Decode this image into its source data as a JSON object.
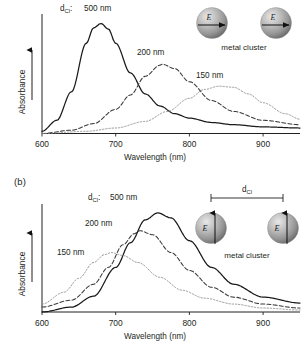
{
  "figure": {
    "panels": [
      {
        "id": "a",
        "label": "",
        "axes": {
          "xlabel": "Wavelength (nm)",
          "ylabel": "Absorbance",
          "xticks": [
            "600",
            "700",
            "800",
            "900"
          ],
          "xlim": [
            600,
            950
          ]
        },
        "prefix_label": "d",
        "prefix_sub": "Cl",
        "prefix_colon": ":",
        "cluster": {
          "caption": "metal cluster",
          "field_label_left": "E",
          "field_label_right": "E",
          "field_orientation": "horizontal",
          "distance_bracket": false,
          "distance_label": "",
          "distance_sub": ""
        }
      },
      {
        "id": "b",
        "label": "(b)",
        "axes": {
          "xlabel": "Wavelength (nm)",
          "ylabel": "Absorbance",
          "xticks": [
            "600",
            "700",
            "800",
            "900"
          ],
          "xlim": [
            600,
            950
          ]
        },
        "prefix_label": "d",
        "prefix_sub": "Cl",
        "prefix_colon": ":",
        "cluster": {
          "caption": "metal cluster",
          "field_label_left": "E",
          "field_label_right": "E",
          "field_orientation": "vertical",
          "distance_bracket": true,
          "distance_label": "d",
          "distance_sub": "Cl"
        }
      }
    ]
  },
  "chart_data": [
    {
      "type": "line",
      "title": "",
      "panel": "a",
      "xlabel": "Wavelength (nm)",
      "ylabel": "Absorbance",
      "xlim": [
        600,
        950
      ],
      "ylim": [
        0,
        1.05
      ],
      "grid": false,
      "legend_position": "inline-annotations",
      "annotations": [
        "dCl: 500 nm",
        "200 nm",
        "150 nm"
      ],
      "series": [
        {
          "name": "500 nm",
          "style": "solid",
          "peak_x": 680,
          "peak_y": 1.0,
          "width_nm": 48,
          "x": [
            600,
            620,
            640,
            660,
            670,
            680,
            690,
            700,
            720,
            740,
            760,
            780,
            800,
            830,
            860,
            900,
            950
          ],
          "y": [
            0.02,
            0.12,
            0.38,
            0.82,
            0.96,
            1.0,
            0.95,
            0.82,
            0.55,
            0.36,
            0.25,
            0.18,
            0.14,
            0.1,
            0.08,
            0.06,
            0.05
          ]
        },
        {
          "name": "200 nm",
          "style": "dashed",
          "peak_x": 763,
          "peak_y": 0.63,
          "width_nm": 62,
          "x": [
            600,
            640,
            670,
            700,
            720,
            740,
            760,
            763,
            780,
            800,
            830,
            860,
            900,
            950
          ],
          "y": [
            0.0,
            0.03,
            0.09,
            0.22,
            0.35,
            0.52,
            0.62,
            0.63,
            0.59,
            0.47,
            0.3,
            0.2,
            0.12,
            0.08
          ]
        },
        {
          "name": "150 nm",
          "style": "dotted",
          "peak_x": 840,
          "peak_y": 0.43,
          "width_nm": 62,
          "x": [
            600,
            660,
            700,
            740,
            770,
            800,
            820,
            840,
            860,
            880,
            900,
            930,
            950
          ],
          "y": [
            0.0,
            0.02,
            0.05,
            0.11,
            0.2,
            0.32,
            0.4,
            0.43,
            0.42,
            0.36,
            0.28,
            0.18,
            0.13
          ]
        }
      ]
    },
    {
      "type": "line",
      "title": "",
      "panel": "b",
      "xlabel": "Wavelength (nm)",
      "ylabel": "Absorbance",
      "xlim": [
        600,
        950
      ],
      "ylim": [
        0,
        1.05
      ],
      "grid": false,
      "legend_position": "inline-annotations",
      "annotations": [
        "dCl: 500 nm",
        "200 nm",
        "150 nm"
      ],
      "series": [
        {
          "name": "500 nm",
          "style": "solid",
          "peak_x": 757,
          "peak_y": 1.0,
          "width_nm": 55,
          "x": [
            600,
            640,
            670,
            700,
            720,
            740,
            757,
            775,
            800,
            830,
            860,
            900,
            950
          ],
          "y": [
            0.0,
            0.05,
            0.16,
            0.45,
            0.7,
            0.93,
            1.0,
            0.95,
            0.72,
            0.45,
            0.28,
            0.15,
            0.09
          ]
        },
        {
          "name": "200 nm",
          "style": "dashed",
          "peak_x": 733,
          "peak_y": 0.82,
          "width_nm": 50,
          "x": [
            600,
            640,
            670,
            690,
            710,
            725,
            733,
            750,
            775,
            800,
            830,
            860,
            900,
            950
          ],
          "y": [
            0.05,
            0.12,
            0.28,
            0.45,
            0.68,
            0.79,
            0.82,
            0.78,
            0.6,
            0.42,
            0.25,
            0.15,
            0.08,
            0.04
          ]
        },
        {
          "name": "150 nm",
          "style": "dotted",
          "peak_x": 694,
          "peak_y": 0.6,
          "width_nm": 48,
          "x": [
            600,
            630,
            650,
            670,
            685,
            694,
            710,
            730,
            760,
            790,
            820,
            860,
            900,
            950
          ],
          "y": [
            0.08,
            0.2,
            0.34,
            0.5,
            0.58,
            0.6,
            0.57,
            0.5,
            0.35,
            0.22,
            0.14,
            0.08,
            0.04,
            0.02
          ]
        }
      ]
    }
  ]
}
